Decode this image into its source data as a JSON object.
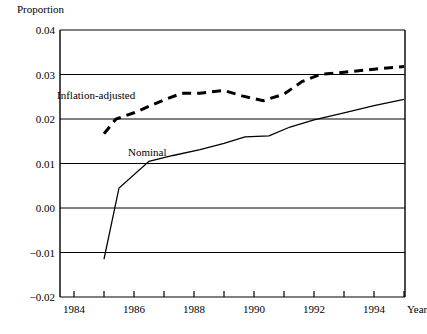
{
  "chart_data": {
    "type": "line",
    "title": "",
    "subtitle": "",
    "xlabel": "Year",
    "ylabel": "Proportion",
    "grid": true,
    "legend_position": "inline-annotations",
    "xlim": [
      1984,
      1995
    ],
    "ylim": [
      -0.02,
      0.04
    ],
    "y_ticks": [
      0.04,
      0.03,
      0.02,
      0.01,
      0.0,
      -0.01,
      -0.02
    ],
    "y_tick_labels": [
      "0.04",
      "0.03",
      "0.02",
      "0.01",
      "0.00",
      "−0.01",
      "−0.02"
    ],
    "x_ticks": [
      1984,
      1985,
      1986,
      1987,
      1988,
      1989,
      1990,
      1991,
      1992,
      1993,
      1994,
      1995
    ],
    "x_tick_labels": [
      "1984",
      "",
      "1986",
      "",
      "1988",
      "",
      "1990",
      "",
      "1992",
      "",
      "1994",
      ""
    ],
    "x_labeled_ticks": [
      {
        "year": 1984,
        "label": "1984"
      },
      {
        "year": 1986,
        "label": "1986"
      },
      {
        "year": 1988,
        "label": "1988"
      },
      {
        "year": 1990,
        "label": "1990"
      },
      {
        "year": 1992,
        "label": "1992"
      },
      {
        "year": 1994,
        "label": "1994"
      }
    ],
    "series": [
      {
        "name": "Inflation-adjusted",
        "style": "dashed",
        "color": "#000000",
        "annotation_label": "Inflation-adjusted",
        "x": [
          1985,
          1985.4,
          1986,
          1987,
          1987.6,
          1988.2,
          1989,
          1989.6,
          1990.3,
          1991,
          1991.6,
          1992.2,
          1993,
          1994,
          1995
        ],
        "values": [
          0.0167,
          0.02,
          0.0214,
          0.0243,
          0.0258,
          0.0258,
          0.0264,
          0.0252,
          0.0241,
          0.0256,
          0.0284,
          0.03,
          0.0305,
          0.0312,
          0.0318
        ]
      },
      {
        "name": "Nominal",
        "style": "solid",
        "color": "#000000",
        "annotation_label": "Nominal",
        "x": [
          1985,
          1985.5,
          1986.5,
          1987.3,
          1988.2,
          1989,
          1989.7,
          1990.5,
          1991.2,
          1992,
          1993,
          1994,
          1995
        ],
        "values": [
          -0.0115,
          0.0045,
          0.0105,
          0.0118,
          0.0131,
          0.0145,
          0.016,
          0.0162,
          0.0182,
          0.0198,
          0.0214,
          0.023,
          0.0244
        ]
      }
    ]
  },
  "axes": {
    "y_title": "Proportion",
    "x_title": "Year"
  }
}
